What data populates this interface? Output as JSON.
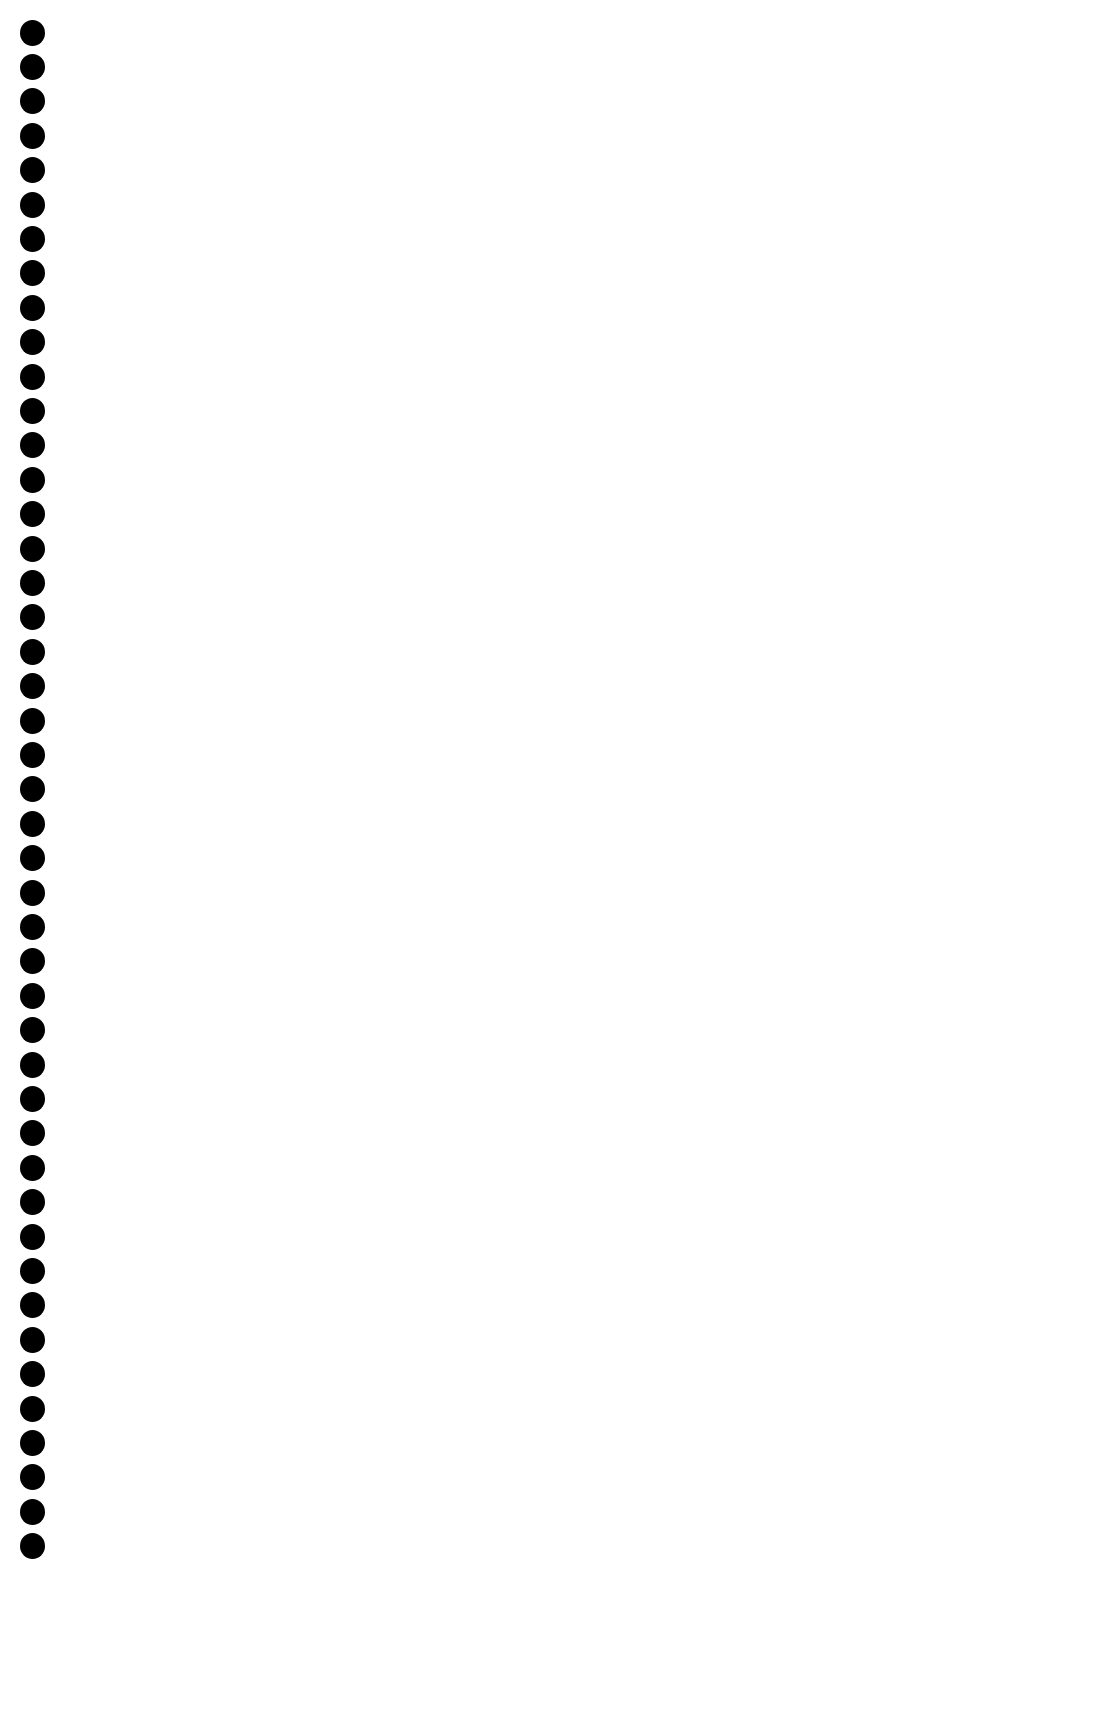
{
  "page": {
    "background_color": "#ffffff",
    "text_lines": []
  },
  "binding": {
    "hole_count": 45,
    "hole_color": "#000000",
    "hole_diameter_px": 25,
    "first_hole_center_y": 32,
    "hole_center_x": 32,
    "hole_spacing_px": 34.4
  }
}
